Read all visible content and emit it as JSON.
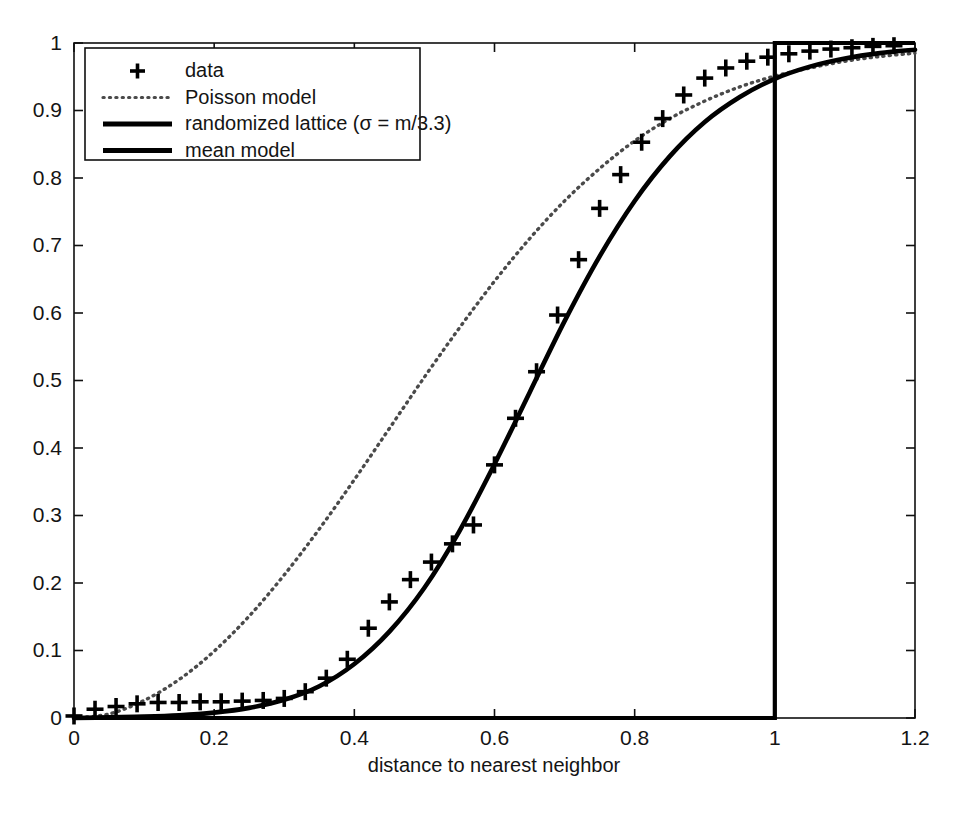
{
  "chart_data": {
    "type": "line",
    "title": "",
    "xlabel": "distance to nearest neighbor",
    "ylabel": "",
    "xlim": [
      0,
      1.2
    ],
    "ylim": [
      0,
      1
    ],
    "grid": false,
    "legend_position": "upper left",
    "xticks": [
      "0",
      "0.2",
      "0.4",
      "0.6",
      "0.8",
      "1",
      "1.2"
    ],
    "xtick_values": [
      0,
      0.2,
      0.4,
      0.6,
      0.8,
      1,
      1.2
    ],
    "yticks": [
      "0",
      "0.1",
      "0.2",
      "0.3",
      "0.4",
      "0.5",
      "0.6",
      "0.7",
      "0.8",
      "0.9",
      "1"
    ],
    "ytick_values": [
      0,
      0.1,
      0.2,
      0.3,
      0.4,
      0.5,
      0.6,
      0.7,
      0.8,
      0.9,
      1.0
    ],
    "series": [
      {
        "name": "data",
        "style": "markers",
        "marker": "plus",
        "color": "#000000",
        "x": [
          0.0,
          0.03,
          0.06,
          0.09,
          0.12,
          0.15,
          0.18,
          0.21,
          0.24,
          0.27,
          0.3,
          0.33,
          0.36,
          0.39,
          0.42,
          0.45,
          0.48,
          0.51,
          0.54,
          0.57,
          0.6,
          0.63,
          0.66,
          0.69,
          0.72,
          0.75,
          0.78,
          0.81,
          0.84,
          0.87,
          0.9,
          0.93,
          0.96,
          0.99,
          1.02,
          1.05,
          1.08,
          1.11,
          1.14,
          1.17
        ],
        "y": [
          0.003,
          0.013,
          0.017,
          0.021,
          0.023,
          0.023,
          0.024,
          0.024,
          0.025,
          0.026,
          0.029,
          0.039,
          0.059,
          0.087,
          0.133,
          0.172,
          0.205,
          0.231,
          0.258,
          0.286,
          0.375,
          0.444,
          0.513,
          0.597,
          0.679,
          0.755,
          0.805,
          0.853,
          0.888,
          0.923,
          0.948,
          0.963,
          0.973,
          0.979,
          0.984,
          0.988,
          0.991,
          0.993,
          0.995,
          0.996
        ]
      },
      {
        "name": "Poisson model",
        "style": "dotted",
        "color": "#4a4a4a",
        "x": [
          0.0,
          0.05,
          0.1,
          0.15,
          0.2,
          0.25,
          0.3,
          0.35,
          0.4,
          0.45,
          0.5,
          0.55,
          0.6,
          0.65,
          0.7,
          0.75,
          0.8,
          0.85,
          0.9,
          0.95,
          1.0,
          1.05,
          1.1,
          1.15,
          1.2
        ],
        "y": [
          0.0,
          0.006,
          0.026,
          0.057,
          0.099,
          0.151,
          0.212,
          0.28,
          0.353,
          0.429,
          0.505,
          0.578,
          0.647,
          0.71,
          0.766,
          0.814,
          0.855,
          0.888,
          0.914,
          0.935,
          0.951,
          0.963,
          0.973,
          0.98,
          0.985
        ]
      },
      {
        "name": "randomized lattice (σ = m/3.3)",
        "style": "solid",
        "color": "#000000",
        "x": [
          0.0,
          0.05,
          0.1,
          0.15,
          0.2,
          0.25,
          0.3,
          0.35,
          0.4,
          0.45,
          0.5,
          0.55,
          0.6,
          0.65,
          0.7,
          0.75,
          0.8,
          0.85,
          0.9,
          0.95,
          1.0,
          1.05,
          1.1,
          1.15,
          1.2
        ],
        "y": [
          0.0,
          0.001,
          0.002,
          0.004,
          0.008,
          0.015,
          0.027,
          0.047,
          0.08,
          0.128,
          0.193,
          0.277,
          0.376,
          0.482,
          0.588,
          0.684,
          0.766,
          0.832,
          0.883,
          0.92,
          0.947,
          0.965,
          0.977,
          0.985,
          0.99
        ]
      },
      {
        "name": "mean model",
        "style": "step",
        "color": "#000000",
        "x": [
          0.0,
          1.0,
          1.0,
          1.2
        ],
        "y": [
          0.0,
          0.0,
          1.0,
          1.0
        ]
      }
    ],
    "legend_entries": [
      {
        "label": "data",
        "symbol": "plus"
      },
      {
        "label": "Poisson model",
        "symbol": "dotted-line"
      },
      {
        "label": "randomized lattice (σ = m/3.3)",
        "symbol": "solid-line"
      },
      {
        "label": "mean model",
        "symbol": "solid-line"
      }
    ],
    "colors": {
      "axis": "#101010",
      "data_marker": "#000000",
      "poisson": "#4a4a4a",
      "lattice": "#000000",
      "mean": "#000000",
      "background": "#ffffff"
    }
  }
}
